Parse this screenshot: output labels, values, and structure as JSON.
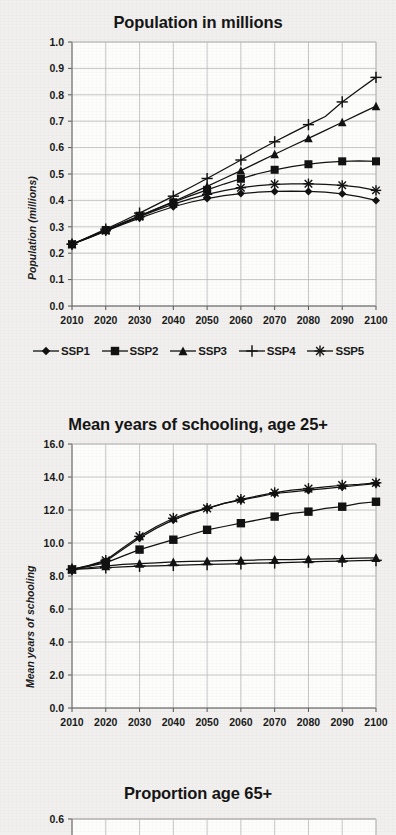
{
  "page": {
    "background_color": "#f1f0ee",
    "ink_color": "#121212",
    "grid_color": "#b9b9b9"
  },
  "legend": {
    "items": [
      {
        "label": "SSP1",
        "marker": "diamond"
      },
      {
        "label": "SSP2",
        "marker": "square"
      },
      {
        "label": "SSP3",
        "marker": "triangle"
      },
      {
        "label": "SSP4",
        "marker": "plus"
      },
      {
        "label": "SSP5",
        "marker": "asterisk"
      }
    ]
  },
  "figures": [
    {
      "id": "population",
      "title": "Population in millions",
      "ylabel": "Population (millions)",
      "has_legend": true
    },
    {
      "id": "schooling",
      "title": "Mean years of schooling, age 25+",
      "ylabel": "Mean years of schooling",
      "has_legend": false
    },
    {
      "id": "proportion65",
      "title": "Proportion age 65+",
      "ylabel": "",
      "has_legend": false
    }
  ],
  "chart_data": [
    {
      "type": "line",
      "title": "Population in millions",
      "xlabel": "",
      "ylabel": "Population (millions)",
      "ylim": [
        0.0,
        1.0
      ],
      "ytick_step": 0.1,
      "ytick_labels": [
        "0.0",
        "0.1",
        "0.2",
        "0.3",
        "0.4",
        "0.5",
        "0.6",
        "0.7",
        "0.8",
        "0.9",
        "1.0"
      ],
      "xlim": [
        2010,
        2100
      ],
      "xtick_labels": [
        "2010",
        "2020",
        "2030",
        "2040",
        "2050",
        "2060",
        "2070",
        "2080",
        "2090",
        "2100"
      ],
      "x": [
        2010,
        2015,
        2020,
        2025,
        2030,
        2035,
        2040,
        2045,
        2050,
        2055,
        2060,
        2065,
        2070,
        2075,
        2080,
        2085,
        2090,
        2095,
        2100
      ],
      "grid": true,
      "legend_position": "below",
      "series": [
        {
          "name": "SSP1",
          "marker": "diamond",
          "values": [
            0.234,
            0.258,
            0.283,
            0.309,
            0.333,
            0.355,
            0.376,
            0.393,
            0.407,
            0.418,
            0.426,
            0.431,
            0.434,
            0.435,
            0.434,
            0.431,
            0.425,
            0.414,
            0.4
          ]
        },
        {
          "name": "SSP2",
          "marker": "square",
          "values": [
            0.234,
            0.261,
            0.288,
            0.315,
            0.342,
            0.368,
            0.393,
            0.417,
            0.44,
            0.462,
            0.482,
            0.501,
            0.516,
            0.528,
            0.537,
            0.544,
            0.548,
            0.55,
            0.548
          ]
        },
        {
          "name": "SSP3",
          "marker": "triangle",
          "values": [
            0.234,
            0.26,
            0.287,
            0.314,
            0.341,
            0.368,
            0.396,
            0.424,
            0.453,
            0.483,
            0.513,
            0.544,
            0.575,
            0.605,
            0.635,
            0.665,
            0.696,
            0.727,
            0.757
          ]
        },
        {
          "name": "SSP4",
          "marker": "plus",
          "values": [
            0.234,
            0.262,
            0.291,
            0.321,
            0.352,
            0.384,
            0.416,
            0.449,
            0.483,
            0.518,
            0.553,
            0.588,
            0.622,
            0.655,
            0.687,
            0.718,
            0.773,
            0.82,
            0.866
          ]
        },
        {
          "name": "SSP5",
          "marker": "asterisk",
          "values": [
            0.234,
            0.259,
            0.285,
            0.312,
            0.338,
            0.363,
            0.386,
            0.406,
            0.423,
            0.437,
            0.448,
            0.456,
            0.461,
            0.463,
            0.463,
            0.461,
            0.457,
            0.45,
            0.438
          ]
        }
      ]
    },
    {
      "type": "line",
      "title": "Mean years of schooling, age 25+",
      "xlabel": "",
      "ylabel": "Mean years of schooling",
      "ylim": [
        0.0,
        16.0
      ],
      "ytick_step": 2.0,
      "ytick_labels": [
        "0.0",
        "2.0",
        "4.0",
        "6.0",
        "8.0",
        "10.0",
        "12.0",
        "14.0",
        "16.0"
      ],
      "xlim": [
        2010,
        2100
      ],
      "xtick_labels": [
        "2010",
        "2020",
        "2030",
        "2040",
        "2050",
        "2060",
        "2070",
        "2080",
        "2090",
        "2100"
      ],
      "x": [
        2010,
        2015,
        2020,
        2025,
        2030,
        2035,
        2040,
        2045,
        2050,
        2055,
        2060,
        2065,
        2070,
        2075,
        2080,
        2085,
        2090,
        2095,
        2100
      ],
      "grid": true,
      "legend_position": "none",
      "series": [
        {
          "name": "SSP1",
          "marker": "diamond",
          "values": [
            8.4,
            8.6,
            8.9,
            9.6,
            10.3,
            10.9,
            11.4,
            11.8,
            12.1,
            12.4,
            12.6,
            12.8,
            13.0,
            13.1,
            13.2,
            13.3,
            13.4,
            13.5,
            13.6
          ]
        },
        {
          "name": "SSP2",
          "marker": "square",
          "values": [
            8.4,
            8.6,
            8.8,
            9.2,
            9.6,
            9.9,
            10.2,
            10.5,
            10.8,
            11.0,
            11.2,
            11.4,
            11.6,
            11.8,
            11.9,
            12.1,
            12.2,
            12.4,
            12.5
          ]
        },
        {
          "name": "SSP3",
          "marker": "triangle",
          "values": [
            8.4,
            8.5,
            8.6,
            8.7,
            8.75,
            8.8,
            8.85,
            8.88,
            8.9,
            8.93,
            8.95,
            8.97,
            9.0,
            9.0,
            9.02,
            9.04,
            9.06,
            9.08,
            9.1
          ]
        },
        {
          "name": "SSP4",
          "marker": "plus",
          "values": [
            8.4,
            8.45,
            8.5,
            8.55,
            8.6,
            8.62,
            8.65,
            8.68,
            8.7,
            8.72,
            8.75,
            8.78,
            8.8,
            8.82,
            8.85,
            8.88,
            8.9,
            8.93,
            8.95
          ]
        },
        {
          "name": "SSP5",
          "marker": "asterisk",
          "values": [
            8.4,
            8.65,
            8.95,
            9.7,
            10.4,
            11.0,
            11.5,
            11.85,
            12.1,
            12.4,
            12.65,
            12.85,
            13.05,
            13.2,
            13.3,
            13.4,
            13.5,
            13.55,
            13.65
          ]
        }
      ]
    },
    {
      "type": "line",
      "title": "Proportion age 65+",
      "xlabel": "",
      "ylabel": "",
      "ylim": [
        0.0,
        0.6
      ],
      "ytick_labels": [
        "0.6"
      ],
      "xlim": [
        2010,
        2100
      ],
      "xtick_labels": [],
      "grid": true,
      "legend_position": "none",
      "series": [],
      "note": "chart cropped at bottom of page; only top gridline visible"
    }
  ]
}
